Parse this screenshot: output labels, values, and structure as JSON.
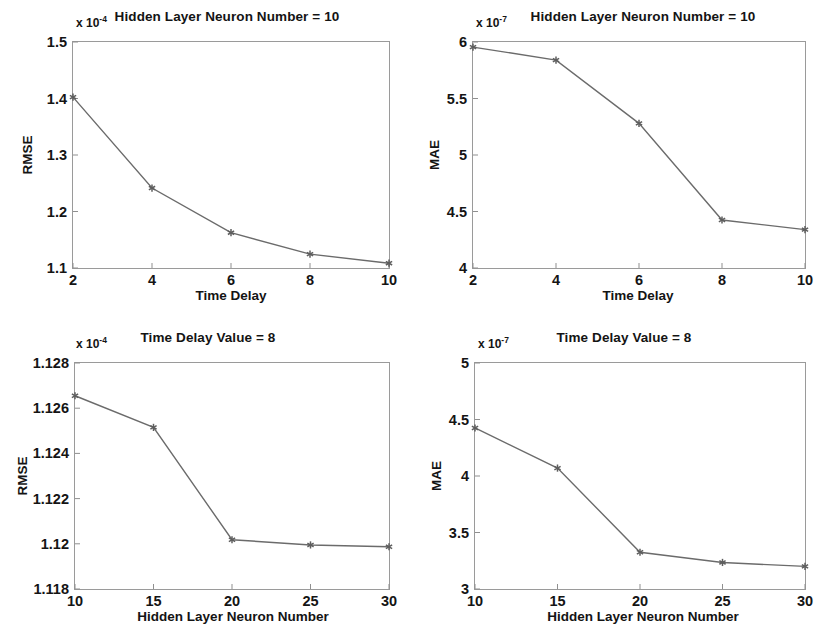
{
  "figure": {
    "background_color": "#ffffff",
    "line_color": "#6b6b6b",
    "axis_color": "#9a9a9a",
    "text_color": "#141414"
  },
  "chart_data": [
    {
      "id": "rmse-vs-time-delay",
      "type": "line",
      "title": "Hidden Layer Neuron Number = 10",
      "xlabel": "Time Delay",
      "ylabel": "RMSE",
      "exponent_label": "x 10",
      "exponent_power": "-4",
      "y_scale": 0.0001,
      "x": [
        2,
        4,
        6,
        8,
        10
      ],
      "values": [
        1.4025,
        1.2415,
        1.1625,
        1.1245,
        1.1085
      ],
      "xticks": [
        2,
        4,
        6,
        8,
        10
      ],
      "xticklabels": [
        "2",
        "4",
        "6",
        "8",
        "10"
      ],
      "yticks": [
        1.1,
        1.2,
        1.3,
        1.4,
        1.5
      ],
      "yticklabels": [
        "1.1",
        "1.2",
        "1.3",
        "1.4",
        "1.5"
      ],
      "xlim": [
        2,
        10
      ],
      "ylim": [
        1.1,
        1.5
      ],
      "grid": false,
      "marker": "asterisk",
      "legend": null
    },
    {
      "id": "mae-vs-time-delay",
      "type": "line",
      "title": "Hidden Layer Neuron Number = 10",
      "xlabel": "Time Delay",
      "ylabel": "MAE",
      "exponent_label": "x 10",
      "exponent_power": "-7",
      "y_scale": 1e-07,
      "x": [
        2,
        4,
        6,
        8,
        10
      ],
      "values": [
        5.955,
        5.84,
        5.28,
        4.425,
        4.34
      ],
      "xticks": [
        2,
        4,
        6,
        8,
        10
      ],
      "xticklabels": [
        "2",
        "4",
        "6",
        "8",
        "10"
      ],
      "yticks": [
        4,
        4.5,
        5,
        5.5,
        6
      ],
      "yticklabels": [
        "4",
        "4.5",
        "5",
        "5.5",
        "6"
      ],
      "xlim": [
        2,
        10
      ],
      "ylim": [
        4,
        6
      ],
      "grid": false,
      "marker": "asterisk",
      "legend": null
    },
    {
      "id": "rmse-vs-neuron-number",
      "type": "line",
      "title": "Time Delay Value = 8",
      "xlabel": "Hidden Layer Neuron Number",
      "ylabel": "RMSE",
      "exponent_label": "x 10",
      "exponent_power": "-4",
      "y_scale": 0.0001,
      "x": [
        10,
        15,
        20,
        25,
        30
      ],
      "values": [
        1.12655,
        1.12515,
        1.12018,
        1.11995,
        1.11987
      ],
      "xticks": [
        10,
        15,
        20,
        25,
        30
      ],
      "xticklabels": [
        "10",
        "15",
        "20",
        "25",
        "30"
      ],
      "yticks": [
        1.118,
        1.12,
        1.122,
        1.124,
        1.126,
        1.128
      ],
      "yticklabels": [
        "1.118",
        "1.12",
        "1.122",
        "1.124",
        "1.126",
        "1.128"
      ],
      "xlim": [
        10,
        30
      ],
      "ylim": [
        1.118,
        1.128
      ],
      "grid": false,
      "marker": "asterisk",
      "legend": null
    },
    {
      "id": "mae-vs-neuron-number",
      "type": "line",
      "title": "Time Delay Value = 8",
      "xlabel": "Hidden Layer Neuron Number",
      "ylabel": "MAE",
      "exponent_label": "x 10",
      "exponent_power": "-7",
      "y_scale": 1e-07,
      "x": [
        10,
        15,
        20,
        25,
        30
      ],
      "values": [
        4.425,
        4.07,
        3.325,
        3.235,
        3.2
      ],
      "xticks": [
        10,
        15,
        20,
        25,
        30
      ],
      "xticklabels": [
        "10",
        "15",
        "20",
        "25",
        "30"
      ],
      "yticks": [
        3,
        3.5,
        4,
        4.5,
        5
      ],
      "yticklabels": [
        "3",
        "3.5",
        "4",
        "4.5",
        "5"
      ],
      "xlim": [
        3,
        5
      ],
      "ylim": [
        3,
        5
      ],
      "grid": false,
      "marker": "asterisk",
      "legend": null
    }
  ]
}
